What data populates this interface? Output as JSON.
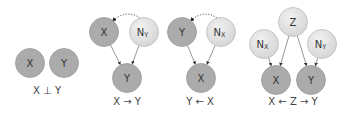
{
  "colors": {
    "observed_fill": "#ababab",
    "observed_stroke": "#9a9a9a",
    "noise_fill_light": "#f2f2f2",
    "noise_fill_dark": "#d4d4d4",
    "noise_stroke": "#bdbdbd",
    "edge": "#8a8a8a",
    "arrowhead": "#333333",
    "confounder_edge": "#555555"
  },
  "node_radius": 14.5,
  "panels": [
    {
      "id": "independent",
      "caption": "X ⊥ Y",
      "caption_pos": [
        47,
        94
      ],
      "nodes": [
        {
          "id": "X",
          "label": "X",
          "sub": "",
          "type": "observed",
          "x": 30,
          "y": 63
        },
        {
          "id": "Y",
          "label": "Y",
          "sub": "",
          "type": "observed",
          "x": 64,
          "y": 63
        }
      ],
      "edges": [],
      "dotted": []
    },
    {
      "id": "x-causes-y",
      "caption": "X → Y",
      "caption_pos": [
        127,
        105
      ],
      "nodes": [
        {
          "id": "X",
          "label": "X",
          "sub": "",
          "type": "observed",
          "x": 104,
          "y": 32
        },
        {
          "id": "NY",
          "label": "N",
          "sub": "Y",
          "type": "noise",
          "x": 144,
          "y": 32
        },
        {
          "id": "Y",
          "label": "Y",
          "sub": "",
          "type": "observed",
          "x": 127,
          "y": 78
        }
      ],
      "edges": [
        {
          "from": "X",
          "to": "Y"
        },
        {
          "from": "NY",
          "to": "Y"
        }
      ],
      "dotted": [
        {
          "from": "NY",
          "to": "X"
        }
      ]
    },
    {
      "id": "y-from-x",
      "caption": "Y ← X",
      "caption_pos": [
        200,
        105
      ],
      "nodes": [
        {
          "id": "Y",
          "label": "Y",
          "sub": "",
          "type": "observed",
          "x": 182,
          "y": 32
        },
        {
          "id": "NX",
          "label": "N",
          "sub": "X",
          "type": "noise",
          "x": 221,
          "y": 32
        },
        {
          "id": "X",
          "label": "X",
          "sub": "",
          "type": "observed",
          "x": 201,
          "y": 78
        }
      ],
      "edges": [
        {
          "from": "Y",
          "to": "X"
        },
        {
          "from": "NX",
          "to": "X"
        }
      ],
      "dotted": [
        {
          "from": "NX",
          "to": "Y"
        }
      ]
    },
    {
      "id": "common-cause",
      "caption": "X ← Z → Y",
      "caption_pos": [
        293,
        105
      ],
      "nodes": [
        {
          "id": "Z",
          "label": "Z",
          "sub": "",
          "type": "noise",
          "x": 293,
          "y": 22
        },
        {
          "id": "NX",
          "label": "N",
          "sub": "X",
          "type": "noise",
          "x": 264,
          "y": 44
        },
        {
          "id": "NY",
          "label": "N",
          "sub": "Y",
          "type": "noise",
          "x": 322,
          "y": 44
        },
        {
          "id": "X",
          "label": "X",
          "sub": "",
          "type": "observed",
          "x": 276,
          "y": 80
        },
        {
          "id": "Y",
          "label": "Y",
          "sub": "",
          "type": "observed",
          "x": 311,
          "y": 80
        }
      ],
      "edges": [
        {
          "from": "NX",
          "to": "X"
        },
        {
          "from": "Z",
          "to": "X"
        },
        {
          "from": "Z",
          "to": "Y"
        },
        {
          "from": "NY",
          "to": "Y"
        }
      ],
      "dotted": []
    }
  ]
}
